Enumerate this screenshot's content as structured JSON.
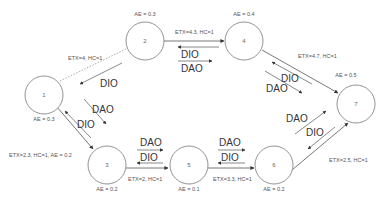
{
  "diagram": {
    "type": "network-topology",
    "nodes": [
      {
        "id": "1",
        "label": "1",
        "ae": "AE = 0.3"
      },
      {
        "id": "2",
        "label": "2",
        "ae": "AE = 0.3"
      },
      {
        "id": "3",
        "label": "3",
        "ae": "AE = 0.2"
      },
      {
        "id": "4",
        "label": "4",
        "ae": "AE = 0.4"
      },
      {
        "id": "5",
        "label": "5",
        "ae": "AE = 0.1"
      },
      {
        "id": "6",
        "label": "6",
        "ae": "AE = 0.2"
      },
      {
        "id": "7",
        "label": "7",
        "ae": "AE = 0.5"
      }
    ],
    "links": [
      {
        "from": "1",
        "to": "2",
        "label": "ETX=4, HC=1",
        "style": "dashed"
      },
      {
        "from": "2",
        "to": "4",
        "label": "ETX=4.3, HC=1",
        "style": "solid"
      },
      {
        "from": "4",
        "to": "7",
        "label": "ETX=4.7, HC=1",
        "style": "solid"
      },
      {
        "from": "1",
        "to": "3",
        "label": "ETX=2.3, HC=1, AE = 0.2",
        "style": "solid"
      },
      {
        "from": "3",
        "to": "5",
        "label": "ETX=2, HC=1",
        "style": "solid"
      },
      {
        "from": "5",
        "to": "6",
        "label": "ETX=3.3, HC=1",
        "style": "solid"
      },
      {
        "from": "6",
        "to": "7",
        "label": "ETX=2.5, HC=1",
        "style": "solid"
      }
    ],
    "messages": {
      "dio": "DIO",
      "dao": "DAO"
    }
  }
}
